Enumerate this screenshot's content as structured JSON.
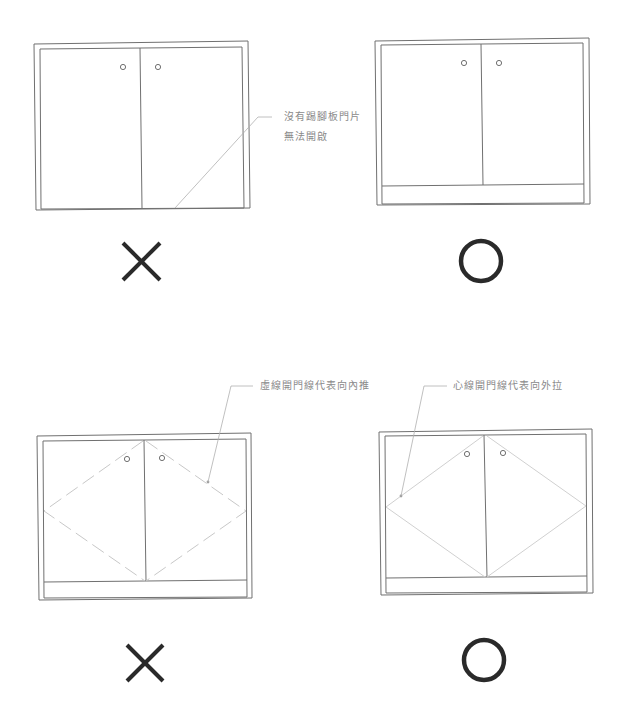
{
  "colors": {
    "frame": "#707070",
    "swing_line": "#c8c8c8",
    "leader": "#b0b0b0",
    "label_text": "#8a8a8a",
    "mark": "#2a2a2a"
  },
  "panels": [
    {
      "id": "top-left",
      "verdict": "incorrect",
      "mark_icon": "cross-icon",
      "has_kick_plate": false,
      "door_swing": "none",
      "annotation": {
        "lines": [
          "沒有踢腳板門片",
          "無法開啟"
        ]
      }
    },
    {
      "id": "top-right",
      "verdict": "correct",
      "mark_icon": "circle-icon",
      "has_kick_plate": true,
      "door_swing": "none"
    },
    {
      "id": "bottom-left",
      "verdict": "incorrect",
      "mark_icon": "cross-icon",
      "has_kick_plate": true,
      "door_swing": "dashed",
      "annotation": {
        "lines": [
          "虛線開門線代表向內推"
        ]
      }
    },
    {
      "id": "bottom-right",
      "verdict": "correct",
      "mark_icon": "circle-icon",
      "has_kick_plate": true,
      "door_swing": "solid",
      "annotation": {
        "lines": [
          "心線開門線代表向外拉"
        ]
      }
    }
  ]
}
